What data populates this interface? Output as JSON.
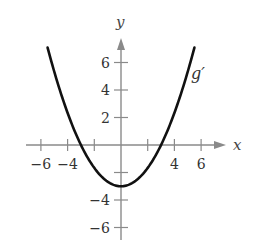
{
  "chart_data": {
    "type": "line",
    "title": "",
    "xlabel": "x",
    "ylabel": "y",
    "xlim": [
      -6.5,
      7.5
    ],
    "ylim": [
      -7,
      8
    ],
    "x_ticks": [
      -6,
      -4,
      -2,
      0,
      2,
      4,
      6
    ],
    "x_tick_labels": [
      "−6",
      "−4",
      "",
      "",
      "",
      "4",
      "6"
    ],
    "y_ticks": [
      -6,
      -4,
      -2,
      0,
      2,
      4,
      6
    ],
    "y_tick_labels": [
      "−6",
      "−4",
      "",
      "",
      "2",
      "4",
      "6"
    ],
    "grid": false,
    "legend": null,
    "series": [
      {
        "name": "g′",
        "formula_estimate": "y = x^2/3 - 3",
        "x": [
          -5.5,
          -5,
          -4,
          -3,
          -2,
          -1,
          0,
          1,
          2,
          3,
          4,
          5,
          5.5
        ],
        "values": [
          7.08,
          5.33,
          2.33,
          0,
          -1.67,
          -2.67,
          -3,
          -2.67,
          -1.67,
          0,
          2.33,
          5.33,
          7.08
        ]
      }
    ],
    "annotations": [
      {
        "text": "g′",
        "x": 5.5,
        "y": 5.5
      }
    ],
    "colors": {
      "curve": "#111111",
      "axes": "#8a8a8a"
    }
  }
}
